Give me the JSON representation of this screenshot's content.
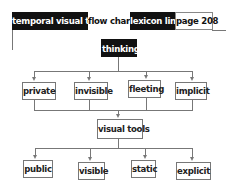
{
  "header": {
    "segments": [
      {
        "label": "temporal visual tool",
        "style": "dark"
      },
      {
        "label": "flow chart",
        "style": "light"
      },
      {
        "label": "lexicon link",
        "style": "dark"
      },
      {
        "label": "page 208",
        "style": "light"
      }
    ]
  },
  "diagram": {
    "root": "thinking",
    "top_row": [
      "private",
      "invisible",
      "fleeting",
      "implicit"
    ],
    "middle": "visual tools",
    "bottom_row": [
      "public",
      "visible",
      "static",
      "explicit"
    ]
  },
  "colors": {
    "dark": "#111111",
    "line": "#777777",
    "background": "#ffffff"
  }
}
